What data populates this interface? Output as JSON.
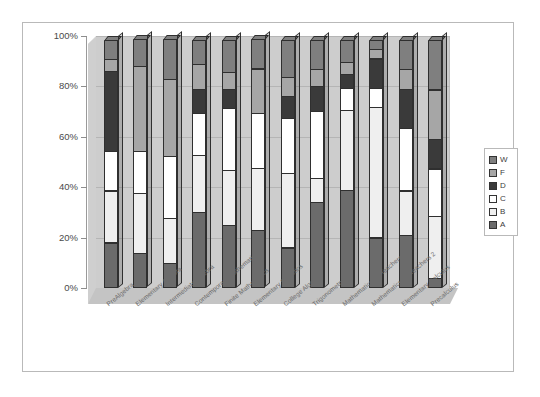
{
  "chart_data": {
    "type": "bar",
    "subtype": "stacked-percentage-3d",
    "title": "",
    "xlabel": "",
    "ylabel": "",
    "ylim": [
      0,
      100
    ],
    "ytick_labels": [
      "100%",
      "80%",
      "60%",
      "40%",
      "20%",
      "0%"
    ],
    "ytick_values": [
      100,
      80,
      60,
      40,
      20,
      0
    ],
    "grid": true,
    "legend_position": "right",
    "legend_entries": [
      "W",
      "F",
      "D",
      "C",
      "B",
      "A"
    ],
    "stack_order_bottom_to_top": [
      "A",
      "B",
      "C",
      "D",
      "F",
      "W"
    ],
    "categories": [
      "PreAlgebra",
      "Elementary Algebra",
      "Intermediate Algebra",
      "Contemporary Mathematics",
      "Finite Mathematics",
      "Elementary Statistics",
      "College Algebra",
      "Trigonometry",
      "Mathematics for Teachers 1",
      "Mathematics for Teachers 2",
      "Elementary Calculus",
      "Precalculus"
    ],
    "series": [
      {
        "name": "A",
        "values": [
          18,
          14,
          10,
          30,
          25,
          23,
          16,
          34,
          39,
          20,
          21,
          4
        ]
      },
      {
        "name": "B",
        "values": [
          21,
          24,
          18,
          23,
          22,
          25,
          30,
          10,
          32,
          52,
          18,
          25
        ]
      },
      {
        "name": "C",
        "values": [
          16,
          17,
          25,
          17,
          25,
          22,
          22,
          27,
          9,
          8,
          25,
          19
        ]
      },
      {
        "name": "D",
        "values": [
          32,
          0,
          0,
          10,
          8,
          0,
          9,
          10,
          6,
          12,
          16,
          12
        ]
      },
      {
        "name": "F",
        "values": [
          5,
          34,
          31,
          10,
          7,
          18,
          8,
          7,
          5,
          4,
          8,
          20
        ]
      },
      {
        "name": "W",
        "values": [
          8,
          11,
          16,
          10,
          13,
          12,
          15,
          12,
          9,
          4,
          12,
          20
        ]
      }
    ],
    "colors": {
      "A": "#6b6b6b",
      "B": "#efefef",
      "C": "#ffffff",
      "D": "#3a3a3a",
      "F": "#a6a6a6",
      "W": "#7f7f7f"
    }
  }
}
